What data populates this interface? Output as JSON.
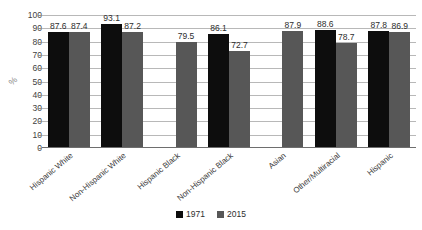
{
  "chart_data": {
    "type": "bar",
    "title": "",
    "subtitle": "",
    "xlabel": "",
    "ylabel": "%",
    "ylim": [
      0,
      100
    ],
    "ytick_step": 10,
    "yticks": [
      "100",
      "90",
      "80",
      "70",
      "60",
      "50",
      "40",
      "30",
      "20",
      "10",
      "0"
    ],
    "grid": true,
    "legend_position": "bottom-center",
    "categories": [
      "Hispanic White",
      "Non-Hispanic White",
      "Hispanic Black",
      "Non-Hispanic Black",
      "Asian",
      "Other/Multiracial",
      "Hispanic"
    ],
    "series": [
      {
        "name": "1971",
        "color": "#0d0d0d",
        "values": [
          87.6,
          93.1,
          null,
          86.1,
          null,
          88.6,
          87.8
        ],
        "labels": [
          "87.6",
          "93.1",
          "",
          "86.1",
          "",
          "88.6",
          "87.8"
        ]
      },
      {
        "name": "2015",
        "color": "#575757",
        "values": [
          87.4,
          87.2,
          79.5,
          72.7,
          87.9,
          78.7,
          86.9
        ],
        "labels": [
          "87.4",
          "87.2",
          "79.5",
          "72.7",
          "87.9",
          "78.7",
          "86.9"
        ]
      }
    ]
  },
  "legend": {
    "items": [
      {
        "label": "1971",
        "color": "#0d0d0d"
      },
      {
        "label": "2015",
        "color": "#575757"
      }
    ]
  },
  "colors": {
    "series_1971": "#0d0d0d",
    "series_2015": "#575757",
    "gridline": "#b8b8b8",
    "axis": "#6e6e6e",
    "background": "#ffffff"
  }
}
